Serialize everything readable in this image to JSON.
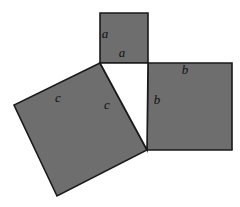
{
  "figure": {
    "canvas": {
      "width": 240,
      "height": 207,
      "background": "#ffffff"
    },
    "style": {
      "fill": "#6e6e6e",
      "stroke": "#1a1a1a",
      "stroke_width": 1.6,
      "triangle_fill": "#ffffff",
      "label_color": "#111111",
      "label_font_size": 13
    },
    "shapes": [
      {
        "name": "square-a",
        "side_label": "a",
        "points": "100,13 148,13 148,63 100,63",
        "fill": "#6e6e6e"
      },
      {
        "name": "square-b",
        "side_label": "b",
        "points": "148,63 232,63 232,150 147,150",
        "fill": "#6e6e6e"
      },
      {
        "name": "square-c",
        "side_label": "c",
        "points": "100,63 14,105 57,196 147,150",
        "fill": "#6e6e6e"
      },
      {
        "name": "right-triangle",
        "side_label": "",
        "points": "100,63 148,63 147,150",
        "fill": "#ffffff"
      }
    ],
    "labels": [
      {
        "name": "label-a-left",
        "text": "a",
        "x": 105,
        "y": 35
      },
      {
        "name": "label-a-lower",
        "text": "a",
        "x": 122,
        "y": 54
      },
      {
        "name": "label-b-top",
        "text": "b",
        "x": 185,
        "y": 71
      },
      {
        "name": "label-b-left",
        "text": "b",
        "x": 157,
        "y": 101
      },
      {
        "name": "label-c-upper",
        "text": "c",
        "x": 58,
        "y": 99
      },
      {
        "name": "label-c-right",
        "text": "c",
        "x": 107,
        "y": 106
      }
    ]
  }
}
